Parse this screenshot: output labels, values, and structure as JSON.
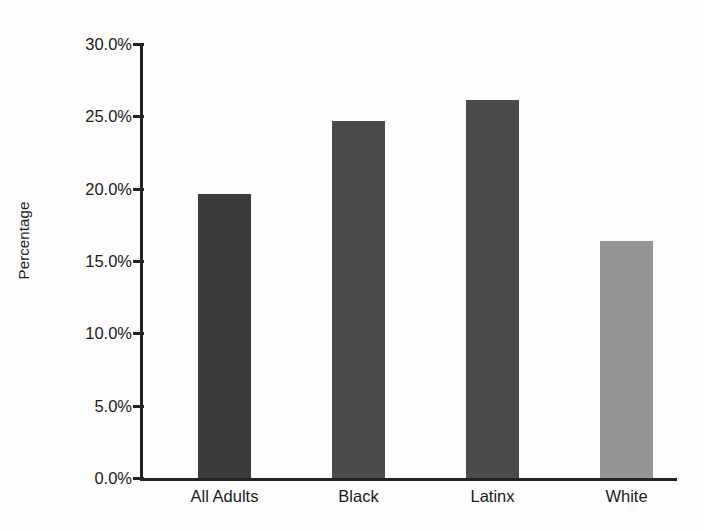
{
  "chart_data": {
    "type": "bar",
    "title": "",
    "subtitle": "",
    "xlabel": "",
    "ylabel": "Percentage",
    "categories": [
      "All Adults",
      "Black",
      "Latinx",
      "White"
    ],
    "values": [
      19.6,
      24.7,
      26.1,
      16.4
    ],
    "value_labels": [
      "19.6%",
      "24.7%",
      "26.1%",
      "16.4%"
    ],
    "bar_colors": [
      "#3b3b3b",
      "#4b4b4b",
      "#4b4b4b",
      "#959595"
    ],
    "ylim": [
      0,
      30
    ],
    "ytick_values": [
      0,
      5,
      10,
      15,
      20,
      25,
      30
    ],
    "ytick_labels": [
      "0.0%",
      "5.0%",
      "10.0%",
      "15.0%",
      "20.0%",
      "25.0%",
      "30.0%"
    ],
    "grid": false,
    "legend": false,
    "legend_position": "none",
    "series": [
      {
        "name": "Percentage",
        "values": [
          19.6,
          24.7,
          26.1,
          16.4
        ]
      }
    ]
  },
  "style": {
    "background": "#fdfdfd",
    "axis_color": "#232323",
    "text_color": "#1a1a1a"
  }
}
